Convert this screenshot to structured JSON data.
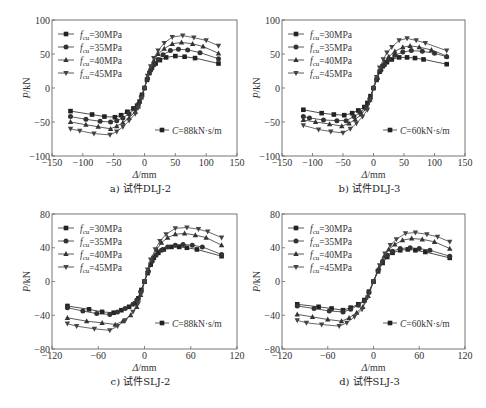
{
  "figure": {
    "legend_prefix": "f",
    "legend_subscript": "cu"
  },
  "chart_data": [
    {
      "id": "a",
      "type": "line",
      "caption": "a) 试件DLJ-2",
      "xlabel": "Δ/mm",
      "ylabel": "P/kN",
      "xlim": [
        -150,
        150
      ],
      "ylim": [
        -100,
        100
      ],
      "xticks": [
        -150,
        -100,
        -50,
        0,
        50,
        100,
        150
      ],
      "yticks": [
        -100,
        -50,
        0,
        50,
        100
      ],
      "annotation": {
        "prefix": "C",
        "text": "=88kN·s/m"
      },
      "legend_position": "top-left",
      "series": [
        {
          "name": "=30MPa",
          "marker": "square",
          "x": [
            -120,
            -85,
            -65,
            -48,
            -38,
            -28,
            -18,
            -12,
            -8,
            -4,
            0,
            4,
            8,
            12,
            18,
            25,
            35,
            50,
            65,
            82,
            120
          ],
          "y": [
            -34,
            -39,
            -42,
            -43,
            -40,
            -35,
            -30,
            -26,
            -20,
            -10,
            0,
            12,
            22,
            30,
            36,
            41,
            45,
            47,
            46,
            44,
            36
          ]
        },
        {
          "name": "=35MPa",
          "marker": "circle",
          "x": [
            -120,
            -95,
            -72,
            -55,
            -45,
            -35,
            -25,
            -15,
            -10,
            -5,
            0,
            5,
            10,
            15,
            22,
            30,
            42,
            55,
            70,
            90,
            120
          ],
          "y": [
            -42,
            -46,
            -49,
            -50,
            -48,
            -44,
            -38,
            -30,
            -24,
            -12,
            0,
            14,
            26,
            34,
            42,
            49,
            55,
            57,
            56,
            52,
            43
          ]
        },
        {
          "name": "=40MPa",
          "marker": "triangle-up",
          "x": [
            -120,
            -95,
            -75,
            -55,
            -45,
            -35,
            -25,
            -15,
            -10,
            -5,
            0,
            5,
            10,
            15,
            22,
            32,
            45,
            60,
            78,
            95,
            120
          ],
          "y": [
            -50,
            -54,
            -57,
            -60,
            -56,
            -51,
            -44,
            -35,
            -27,
            -14,
            0,
            16,
            30,
            40,
            50,
            58,
            65,
            67,
            65,
            61,
            51
          ]
        },
        {
          "name": "=45MPa",
          "marker": "triangle-down",
          "x": [
            -120,
            -105,
            -82,
            -56,
            -45,
            -35,
            -25,
            -15,
            -10,
            -5,
            0,
            5,
            10,
            15,
            22,
            32,
            45,
            62,
            80,
            100,
            120
          ],
          "y": [
            -60,
            -63,
            -67,
            -69,
            -64,
            -57,
            -48,
            -38,
            -29,
            -15,
            0,
            18,
            32,
            44,
            55,
            66,
            75,
            77,
            74,
            70,
            62
          ]
        }
      ]
    },
    {
      "id": "b",
      "type": "line",
      "caption": "b) 试件DLJ-3",
      "xlabel": "Δ/mm",
      "ylabel": "P/kN",
      "xlim": [
        -150,
        150
      ],
      "ylim": [
        -100,
        100
      ],
      "xticks": [
        -150,
        -100,
        -50,
        0,
        50,
        100,
        150
      ],
      "yticks": [
        -100,
        -50,
        0,
        50,
        100
      ],
      "annotation": {
        "prefix": "C",
        "text": "=60kN·s/m"
      },
      "legend_position": "top-left",
      "series": [
        {
          "name": "=30MPa",
          "marker": "square",
          "x": [
            -115,
            -85,
            -65,
            -48,
            -35,
            -25,
            -15,
            -10,
            -5,
            0,
            5,
            10,
            15,
            22,
            30,
            42,
            55,
            68,
            82,
            120
          ],
          "y": [
            -32,
            -37,
            -39,
            -40,
            -37,
            -33,
            -28,
            -22,
            -12,
            0,
            12,
            24,
            32,
            38,
            42,
            45,
            45,
            44,
            42,
            35
          ]
        },
        {
          "name": "=35MPa",
          "marker": "circle",
          "x": [
            -115,
            -105,
            -82,
            -60,
            -45,
            -32,
            -22,
            -12,
            -6,
            0,
            6,
            12,
            18,
            25,
            35,
            48,
            62,
            80,
            100,
            120
          ],
          "y": [
            -42,
            -44,
            -47,
            -48,
            -48,
            -42,
            -36,
            -28,
            -16,
            0,
            14,
            26,
            34,
            42,
            48,
            53,
            55,
            54,
            51,
            46
          ]
        },
        {
          "name": "=40MPa",
          "marker": "triangle-up",
          "x": [
            -115,
            -95,
            -72,
            -52,
            -40,
            -30,
            -20,
            -12,
            -6,
            0,
            6,
            12,
            18,
            25,
            35,
            48,
            60,
            75,
            95,
            120
          ],
          "y": [
            -47,
            -50,
            -53,
            -56,
            -52,
            -46,
            -39,
            -30,
            -17,
            0,
            15,
            28,
            38,
            46,
            54,
            60,
            62,
            60,
            56,
            47
          ]
        },
        {
          "name": "=45MPa",
          "marker": "triangle-down",
          "x": [
            -115,
            -90,
            -70,
            -50,
            -38,
            -28,
            -18,
            -10,
            -5,
            0,
            5,
            10,
            16,
            22,
            30,
            42,
            55,
            70,
            85,
            120
          ],
          "y": [
            -55,
            -61,
            -64,
            -66,
            -60,
            -52,
            -42,
            -32,
            -18,
            0,
            16,
            30,
            42,
            52,
            60,
            70,
            73,
            70,
            66,
            55
          ]
        }
      ]
    },
    {
      "id": "c",
      "type": "line",
      "caption": "c) 试件SLJ-2",
      "xlabel": "Δ/mm",
      "ylabel": "P/kN",
      "xlim": [
        -120,
        120
      ],
      "ylim": [
        -80,
        80
      ],
      "xticks": [
        -120,
        -60,
        0,
        60,
        120
      ],
      "yticks": [
        -80,
        -40,
        0,
        40,
        80
      ],
      "annotation": {
        "prefix": "C",
        "text": "=88kN·s/m"
      },
      "legend_position": "top-left",
      "series": [
        {
          "name": "=30MPa",
          "marker": "square",
          "x": [
            -100,
            -72,
            -55,
            -40,
            -30,
            -20,
            -12,
            -8,
            -4,
            0,
            4,
            8,
            12,
            18,
            25,
            35,
            45,
            55,
            68,
            100
          ],
          "y": [
            -29,
            -33,
            -36,
            -37,
            -34,
            -30,
            -26,
            -20,
            -10,
            0,
            10,
            20,
            28,
            34,
            38,
            41,
            41,
            40,
            38,
            30
          ]
        },
        {
          "name": "=35MPa",
          "marker": "circle",
          "x": [
            -100,
            -80,
            -62,
            -45,
            -35,
            -25,
            -15,
            -10,
            -5,
            0,
            5,
            10,
            15,
            22,
            30,
            40,
            50,
            62,
            75,
            100
          ],
          "y": [
            -31,
            -35,
            -38,
            -39,
            -36,
            -32,
            -27,
            -22,
            -12,
            0,
            12,
            24,
            31,
            37,
            41,
            43,
            44,
            43,
            41,
            32
          ]
        },
        {
          "name": "=40MPa",
          "marker": "triangle-up",
          "x": [
            -100,
            -75,
            -55,
            -38,
            -28,
            -18,
            -10,
            -5,
            0,
            5,
            10,
            16,
            22,
            30,
            40,
            52,
            66,
            80,
            100
          ],
          "y": [
            -43,
            -47,
            -49,
            -51,
            -47,
            -40,
            -30,
            -16,
            0,
            14,
            28,
            38,
            46,
            52,
            56,
            57,
            55,
            52,
            43
          ]
        },
        {
          "name": "=45MPa",
          "marker": "triangle-down",
          "x": [
            -100,
            -88,
            -65,
            -45,
            -35,
            -25,
            -15,
            -8,
            -4,
            0,
            4,
            8,
            14,
            20,
            28,
            40,
            55,
            70,
            82,
            100
          ],
          "y": [
            -50,
            -53,
            -56,
            -58,
            -53,
            -46,
            -36,
            -26,
            -14,
            0,
            14,
            26,
            38,
            48,
            56,
            63,
            64,
            62,
            59,
            52
          ]
        }
      ]
    },
    {
      "id": "d",
      "type": "line",
      "caption": "d) 试件SLJ-3",
      "xlabel": "Δ/mm",
      "ylabel": "P/kN",
      "xlim": [
        -120,
        120
      ],
      "ylim": [
        -80,
        80
      ],
      "xticks": [
        -120,
        -60,
        0,
        60,
        120
      ],
      "yticks": [
        -80,
        -40,
        0,
        40,
        80
      ],
      "annotation": {
        "prefix": "C",
        "text": "=60kN·s/m"
      },
      "legend_position": "top-left",
      "series": [
        {
          "name": "=30MPa",
          "marker": "square",
          "x": [
            -100,
            -72,
            -55,
            -40,
            -30,
            -20,
            -12,
            -6,
            0,
            6,
            12,
            18,
            25,
            35,
            45,
            55,
            68,
            100
          ],
          "y": [
            -27,
            -30,
            -32,
            -34,
            -31,
            -27,
            -22,
            -12,
            0,
            12,
            22,
            29,
            34,
            37,
            38,
            37,
            35,
            28
          ]
        },
        {
          "name": "=35MPa",
          "marker": "circle",
          "x": [
            -100,
            -78,
            -58,
            -40,
            -30,
            -20,
            -12,
            -6,
            0,
            6,
            12,
            18,
            25,
            35,
            48,
            60,
            74,
            100
          ],
          "y": [
            -29,
            -32,
            -35,
            -36,
            -33,
            -28,
            -23,
            -13,
            0,
            13,
            24,
            31,
            36,
            39,
            40,
            39,
            37,
            30
          ]
        },
        {
          "name": "=40MPa",
          "marker": "triangle-up",
          "x": [
            -100,
            -80,
            -60,
            -42,
            -32,
            -22,
            -14,
            -7,
            0,
            7,
            14,
            20,
            28,
            38,
            50,
            64,
            80,
            100
          ],
          "y": [
            -39,
            -42,
            -45,
            -47,
            -43,
            -37,
            -30,
            -17,
            0,
            16,
            30,
            38,
            44,
            49,
            51,
            50,
            47,
            39
          ]
        },
        {
          "name": "=45MPa",
          "marker": "triangle-down",
          "x": [
            -100,
            -88,
            -68,
            -45,
            -35,
            -25,
            -15,
            -8,
            0,
            8,
            15,
            22,
            30,
            42,
            55,
            70,
            84,
            100
          ],
          "y": [
            -46,
            -49,
            -51,
            -53,
            -49,
            -42,
            -33,
            -19,
            0,
            19,
            33,
            43,
            50,
            57,
            58,
            56,
            53,
            47
          ]
        }
      ]
    }
  ]
}
